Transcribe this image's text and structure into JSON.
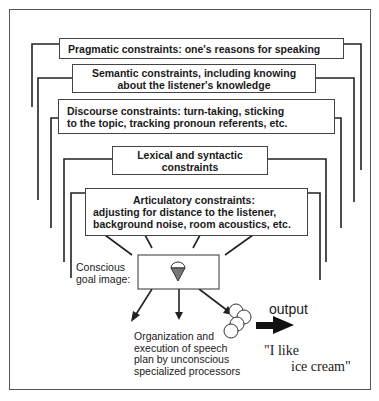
{
  "diagram": {
    "constraints": [
      {
        "id": "pragmatic",
        "line1": "Pragmatic constraints:  one's reasons for speaking",
        "line2": ""
      },
      {
        "id": "semantic",
        "line1": "Semantic constraints, including knowing",
        "line2": "about the listener's knowledge"
      },
      {
        "id": "discourse",
        "line1": "Discourse constraints: turn-taking, sticking",
        "line2": "to the topic, tracking pronoun referents, etc."
      },
      {
        "id": "lexical",
        "line1": "Lexical and syntactic",
        "line2": "constraints"
      },
      {
        "id": "articulatory",
        "line1": "Articulatory constraints:",
        "line2": "adjusting for distance to the listener,",
        "line3": "background noise, room acoustics,  etc."
      }
    ],
    "goal_label": {
      "line1": "Conscious",
      "line2": "goal image:"
    },
    "goal_icon": "ice-cream-cone-icon",
    "processors_label": {
      "line1": "Organization and",
      "line2": "execution of speech",
      "line3": "plan by unconscious",
      "line4": "specialized processors"
    },
    "processors_icon": "processor-circles-icon",
    "output_label": "output",
    "output_arrow_icon": "right-arrow-icon",
    "utterance": {
      "line1": "\"I like",
      "line2": "ice cream\""
    }
  }
}
